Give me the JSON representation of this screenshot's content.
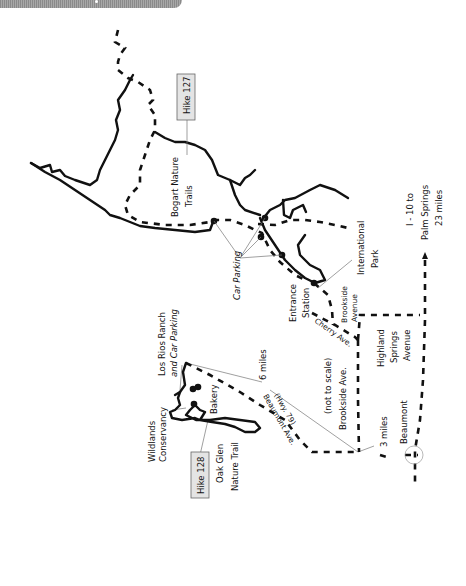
{
  "map": {
    "hike_labels": [
      {
        "id": "hike-127",
        "text": "Hike 127"
      },
      {
        "id": "hike-128",
        "text": "Hike 128"
      }
    ],
    "places": {
      "bogart_line1": "Bogart Nature",
      "bogart_line2": "Trails",
      "car_parking": "Car Parking",
      "international_line1": "International",
      "international_line2": "Park",
      "entrance_line1": "Entrance",
      "entrance_line2": "Station",
      "brookside_avenue_line1": "Brookside",
      "brookside_avenue_line2": "Avenue",
      "cherry_ave": "Cherry Ave.",
      "highland_line1": "Highland",
      "highland_line2": "Springs",
      "highland_line3": "Avenue",
      "i10_line1": "I - 10 to",
      "i10_line2": "Palm Springs",
      "i10_line3": "23 miles",
      "los_rios_line1": "Los Rios Ranch",
      "los_rios_line2": "and Car Parking",
      "six_miles": "6 miles",
      "not_to_scale": "(not to scale)",
      "brookside_ave": "Brookside Ave.",
      "beaumont_ave": "Beaumont Ave.",
      "hwy79": "(Hwy. 79)",
      "wildlands_line1": "Wildlands",
      "wildlands_line2": "Conservancy",
      "bakery": "Bakery",
      "oak_glen_line1": "Oak Glen",
      "oak_glen_line2": "Nature Trail",
      "three_miles": "3 miles",
      "beaumont": "Beaumont"
    },
    "colors": {
      "ink": "#111111",
      "label_box": "#e4e4e4",
      "header_bar": "#999999"
    }
  }
}
